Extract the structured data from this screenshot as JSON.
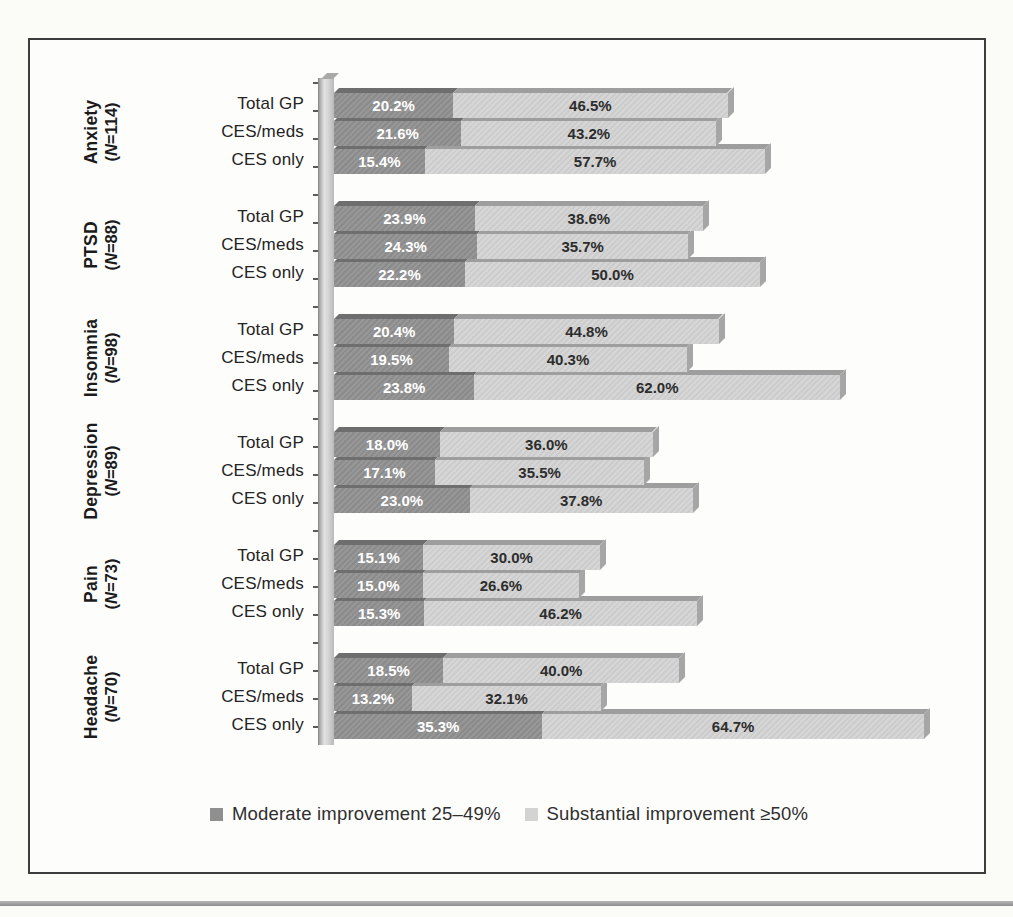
{
  "chart_data": {
    "type": "bar",
    "orientation": "horizontal",
    "stacked": true,
    "grid": false,
    "legend_position": "bottom",
    "xlim": [
      0,
      100
    ],
    "value_unit": "%",
    "series": [
      {
        "name": "Moderate improvement 25–49%",
        "color": "#8f8f8f",
        "value_text_color": "#ffffff"
      },
      {
        "name": "Substantial improvement ≥50%",
        "color": "#d3d3d3",
        "value_text_color": "#2d2d2d"
      }
    ],
    "row_labels": [
      "Total GP",
      "CES/meds",
      "CES only"
    ],
    "groups": [
      {
        "condition": "Anxiety",
        "n_label": "(N=114)",
        "rows": [
          [
            20.2,
            46.5
          ],
          [
            21.6,
            43.2
          ],
          [
            15.4,
            57.7
          ]
        ]
      },
      {
        "condition": "PTSD",
        "n_label": "(N=88)",
        "rows": [
          [
            23.9,
            38.6
          ],
          [
            24.3,
            35.7
          ],
          [
            22.2,
            50.0
          ]
        ]
      },
      {
        "condition": "Insomnia",
        "n_label": "(N=98)",
        "rows": [
          [
            20.4,
            44.8
          ],
          [
            19.5,
            40.3
          ],
          [
            23.8,
            62.0
          ]
        ]
      },
      {
        "condition": "Depression",
        "n_label": "(N=89)",
        "rows": [
          [
            18.0,
            36.0
          ],
          [
            17.1,
            35.5
          ],
          [
            23.0,
            37.8
          ]
        ]
      },
      {
        "condition": "Pain",
        "n_label": "(N=73)",
        "rows": [
          [
            15.1,
            30.0
          ],
          [
            15.0,
            26.6
          ],
          [
            15.3,
            46.2
          ]
        ]
      },
      {
        "condition": "Headache",
        "n_label": "(N=70)",
        "rows": [
          [
            18.5,
            40.0
          ],
          [
            13.2,
            32.1
          ],
          [
            35.3,
            64.7
          ]
        ]
      }
    ]
  }
}
